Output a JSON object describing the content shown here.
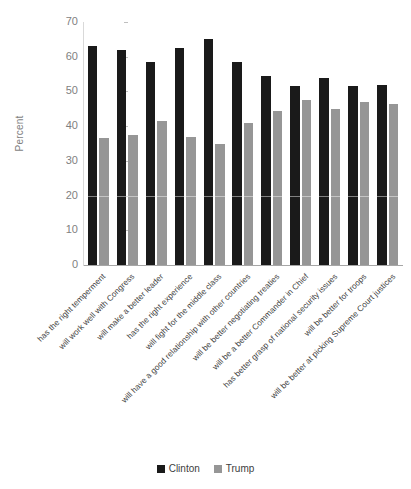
{
  "chart_data": {
    "type": "bar",
    "title": "",
    "xlabel": "",
    "ylabel": "Percent",
    "ylim": [
      0,
      70
    ],
    "yticks": [
      0,
      10,
      20,
      30,
      40,
      50,
      60,
      70
    ],
    "grid": false,
    "legend_position": "bottom",
    "categories": [
      "has the right temperment",
      "will work well with Congress",
      "will make a better leader",
      "has the right experience",
      "will fight for the middle class",
      "will have a good relationship with other countries",
      "will be better negotiating treaties",
      "will be a better Commander in Chief",
      "has better grasp of national security issues",
      "will be better for troops",
      "will be better at picking Supreme Court justices"
    ],
    "series": [
      {
        "name": "Clinton",
        "color": "#1a1a1a",
        "values": [
          63,
          62,
          58.5,
          62.5,
          65,
          58.5,
          54.5,
          51.5,
          54,
          51.5,
          52
        ]
      },
      {
        "name": "Trump",
        "color": "#969696",
        "values": [
          36.5,
          37.5,
          41.5,
          37,
          35,
          41,
          44.5,
          47.5,
          45,
          47,
          46.5
        ]
      }
    ]
  },
  "legend": {
    "items": [
      {
        "label": "Clinton",
        "color": "#1a1a1a"
      },
      {
        "label": "Trump",
        "color": "#969696"
      }
    ]
  },
  "colors": {
    "clinton": "#1a1a1a",
    "trump": "#969696",
    "axis": "#a6a6a6",
    "tick_text": "#7f7f7f",
    "category_text": "#404040",
    "background": "#ffffff"
  }
}
